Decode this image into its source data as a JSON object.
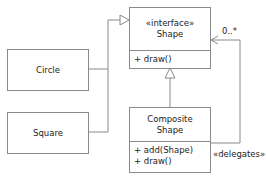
{
  "diagram": {
    "type": "uml-class-diagram",
    "classes": {
      "shape": {
        "stereotype": "«interface»",
        "name": "Shape",
        "operations": [
          "+ draw()"
        ]
      },
      "circle": {
        "name": "Circle"
      },
      "square": {
        "name": "Square"
      },
      "composite": {
        "name_line1": "Composite",
        "name_line2": "Shape",
        "operations": [
          "+ add(Shape)",
          "+ draw()"
        ]
      }
    },
    "relations": {
      "multiplicity": "0..*",
      "delegates_label": "«delegates»"
    },
    "colors": {
      "line": "#8a8a8a",
      "text": "#222222"
    }
  }
}
